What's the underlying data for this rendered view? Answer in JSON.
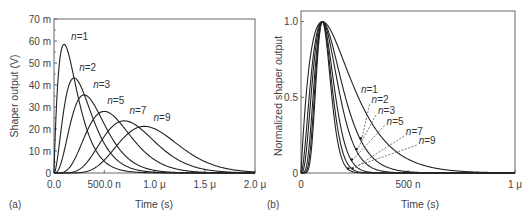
{
  "chart_data": [
    {
      "type": "line",
      "panel_label": "(a)",
      "title": "",
      "xlabel": "Time (s)",
      "ylabel": "Shaper output (V)",
      "xlim": [
        0,
        2e-06
      ],
      "ylim": [
        0,
        0.07
      ],
      "x_ticks": [
        0,
        5e-07,
        1e-06,
        1.5e-06,
        2e-06
      ],
      "x_tick_labels": [
        "0.0",
        "500.0 n",
        "1.0 μ",
        "1.5 μ",
        "2.0 μ"
      ],
      "y_ticks": [
        0,
        0.01,
        0.02,
        0.03,
        0.04,
        0.05,
        0.06,
        0.07
      ],
      "y_tick_labels": [
        "0",
        "10 m",
        "20 m",
        "30 m",
        "40 m",
        "50 m",
        "60 m",
        "70 m"
      ],
      "grid": false,
      "model": "CR-RC^n shaper, v(t) = A (t/tau)^n exp(n - t/tau), tau = 100 ns",
      "series": [
        {
          "name": "n = 1",
          "n": 1,
          "peak_time": 1e-07,
          "peak_value": 0.0585,
          "label_x": 1.7e-07,
          "label_y": 0.0605
        },
        {
          "name": "n = 2",
          "n": 2,
          "peak_time": 2e-07,
          "peak_value": 0.0432,
          "label_x": 2.5e-07,
          "label_y": 0.0465
        },
        {
          "name": "n = 3",
          "n": 3,
          "peak_time": 3e-07,
          "peak_value": 0.0355,
          "label_x": 3.9e-07,
          "label_y": 0.0385
        },
        {
          "name": "n = 5",
          "n": 5,
          "peak_time": 5e-07,
          "peak_value": 0.028,
          "label_x": 5.3e-07,
          "label_y": 0.0315
        },
        {
          "name": "n = 7",
          "n": 7,
          "peak_time": 7e-07,
          "peak_value": 0.0237,
          "label_x": 7.5e-07,
          "label_y": 0.027
        },
        {
          "name": "n = 9",
          "n": 9,
          "peak_time": 9e-07,
          "peak_value": 0.0212,
          "label_x": 9.9e-07,
          "label_y": 0.0235
        }
      ]
    },
    {
      "type": "line",
      "panel_label": "(b)",
      "title": "",
      "xlabel": "Time (s)",
      "ylabel": "Normalized shaper output",
      "xlim": [
        0,
        1e-06
      ],
      "ylim": [
        0,
        1.07
      ],
      "x_ticks": [
        0,
        5e-07,
        1e-06
      ],
      "x_tick_labels": [
        "0",
        "500 n",
        "1 μ"
      ],
      "y_ticks": [
        0,
        0.5,
        1.0
      ],
      "y_tick_labels": [
        "0",
        "0.5",
        "1.0"
      ],
      "grid": false,
      "model": "CR-RC^n shaper normalized, fixed peaking time 100 ns",
      "series": [
        {
          "name": "n = 1",
          "n": 1,
          "peak_time": 1e-07,
          "peak_value": 1.0,
          "label_x": 2.8e-07,
          "label_y": 0.53,
          "arrow": false
        },
        {
          "name": "n = 2",
          "n": 2,
          "peak_time": 1e-07,
          "peak_value": 1.0,
          "label_x": 3.3e-07,
          "label_y": 0.46,
          "arrow": true
        },
        {
          "name": "n = 3",
          "n": 3,
          "peak_time": 1e-07,
          "peak_value": 1.0,
          "label_x": 3.6e-07,
          "label_y": 0.39,
          "arrow": true
        },
        {
          "name": "n = 5",
          "n": 5,
          "peak_time": 1e-07,
          "peak_value": 1.0,
          "label_x": 4e-07,
          "label_y": 0.32,
          "arrow": true
        },
        {
          "name": "n = 7",
          "n": 7,
          "peak_time": 1e-07,
          "peak_value": 1.0,
          "label_x": 4.9e-07,
          "label_y": 0.25,
          "arrow": true
        },
        {
          "name": "n = 9",
          "n": 9,
          "peak_time": 1e-07,
          "peak_value": 1.0,
          "label_x": 5.5e-07,
          "label_y": 0.19,
          "arrow": true
        }
      ]
    }
  ]
}
